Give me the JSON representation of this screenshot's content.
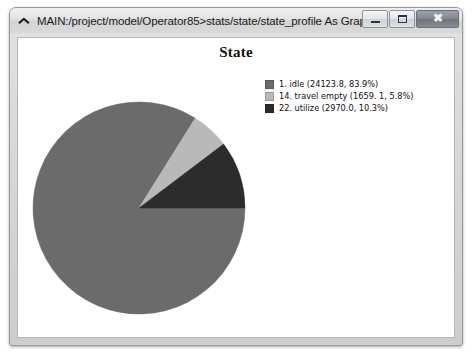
{
  "window": {
    "title": "MAIN:/project/model/Operator85>stats/state/state_profile As Graph",
    "icon": "chevron-up-icon",
    "buttons": {
      "minimize": "minimize-button",
      "maximize": "maximize-button",
      "close_glyph": "✖"
    }
  },
  "chart_data": {
    "type": "pie",
    "title": "State",
    "xlabel": "",
    "ylabel": "",
    "legend_position": "top-right",
    "grid": false,
    "start_angle_deg": 0,
    "direction": "clockwise",
    "categories": [
      "1. idle",
      "14. travel empty",
      "22. utilize"
    ],
    "values": [
      24123.8,
      1659.1,
      2970.0
    ],
    "percentages": [
      83.9,
      5.8,
      10.3
    ],
    "colors": [
      "#6b6b6b",
      "#b9b9b9",
      "#2c2c2c"
    ],
    "slices": [
      {
        "index": "1",
        "name": "idle",
        "value": 24123.8,
        "percent": 83.9,
        "color": "#6b6b6b",
        "legend_label": "1. idle (24123.8, 83.9%)"
      },
      {
        "index": "14",
        "name": "travel empty",
        "value": 1659.1,
        "percent": 5.8,
        "color": "#b9b9b9",
        "legend_label": "14. travel empty (1659. 1, 5.8%)"
      },
      {
        "index": "22",
        "name": "utilize",
        "value": 2970.0,
        "percent": 10.3,
        "color": "#2c2c2c",
        "legend_label": "22. utilize (2970.0, 10.3%)"
      }
    ]
  }
}
